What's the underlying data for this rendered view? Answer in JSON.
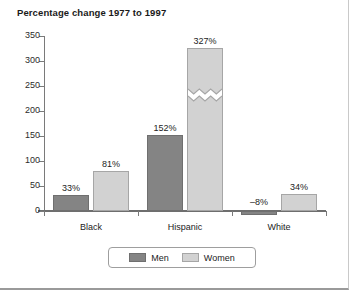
{
  "chart_data": {
    "type": "bar",
    "title": "Percentage change 1977 to 1997",
    "xlabel": "",
    "ylabel": "",
    "categories": [
      "Black",
      "Hispanic",
      "White"
    ],
    "series": [
      {
        "name": "Men",
        "values": [
          33,
          152,
          -8
        ],
        "color": "#848484",
        "labels": [
          "33%",
          "152%",
          "–8%"
        ]
      },
      {
        "name": "Women",
        "values": [
          81,
          327,
          34
        ],
        "color": "#d2d2d2",
        "labels": [
          "81%",
          "327%",
          "34%"
        ]
      }
    ],
    "ylim": [
      0,
      350
    ],
    "yticks": [
      0,
      50,
      100,
      150,
      200,
      250,
      300,
      350
    ],
    "ytick_labels": [
      "0",
      "50",
      "100",
      "150",
      "200",
      "250",
      "300",
      "350"
    ],
    "grid": false,
    "legend_position": "bottom",
    "axis_break": {
      "series": "Women",
      "category": "Hispanic",
      "note": "zigzag scale break drawn across bar"
    }
  },
  "legend": {
    "entries": [
      {
        "label": "Men"
      },
      {
        "label": "Women"
      }
    ]
  }
}
